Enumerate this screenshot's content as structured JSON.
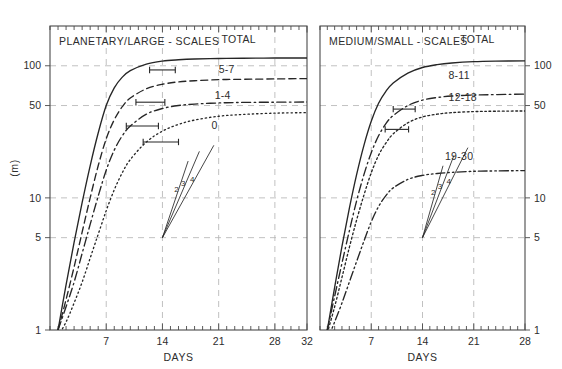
{
  "figure": {
    "background_color": "#ffffff",
    "width": 562,
    "height": 369
  },
  "chart_data": [
    {
      "type": "line",
      "panel": "left",
      "title": "PLANETARY/LARGE - SCALES",
      "xlabel": "DAYS",
      "ylabel": "(m)",
      "xlim": [
        0,
        32
      ],
      "ylim": [
        1,
        200
      ],
      "yscale": "log",
      "xticks": [
        7,
        14,
        21,
        28,
        32
      ],
      "xticklabels": [
        "7",
        "14",
        "21",
        "28",
        "32"
      ],
      "yticks": [
        1,
        5,
        10,
        50,
        100
      ],
      "yticklabels": [
        "1",
        "5",
        "10",
        "50",
        "100"
      ],
      "ylabel_side": "left",
      "grid": true,
      "legend": "inline-labels",
      "series": [
        {
          "name": "TOTAL",
          "style": "solid",
          "label": "TOTAL",
          "label_x": 23.5,
          "label_y": 150,
          "saturation": 120,
          "growth_day": 7.2,
          "x": [
            1,
            2,
            3,
            4,
            5,
            6,
            7,
            8,
            9,
            10,
            12,
            14,
            16,
            18,
            21,
            24,
            28,
            32
          ],
          "y": [
            1.0,
            2.2,
            4.6,
            9.2,
            17.5,
            31.0,
            50.0,
            68.0,
            82.0,
            92.0,
            103.0,
            108.5,
            111.0,
            112.5,
            113.5,
            114.0,
            114.5,
            114.5
          ],
          "errorbar": {
            "x": 14,
            "y": 93,
            "halfwidth_days": 1.6
          }
        },
        {
          "name": "5-7",
          "style": "dashed",
          "label": "5-7",
          "label_x": 22.0,
          "label_y": 88,
          "x": [
            1,
            2,
            3,
            4,
            5,
            6,
            7,
            8,
            9,
            10,
            12,
            14,
            16,
            18,
            21,
            24,
            28,
            32
          ],
          "y": [
            1.0,
            1.7,
            3.0,
            5.5,
            10.0,
            17.5,
            28.0,
            39.0,
            49.0,
            57.0,
            67.0,
            72.5,
            75.5,
            77.0,
            78.5,
            79.0,
            79.5,
            80.0
          ],
          "errorbar": {
            "x": 12.5,
            "y": 53,
            "halfwidth_days": 1.8
          }
        },
        {
          "name": "1-4",
          "style": "dashdot",
          "label": "1-4",
          "label_x": 21.5,
          "label_y": 56,
          "x": [
            1,
            2,
            3,
            4,
            5,
            6,
            7,
            8,
            9,
            10,
            12,
            14,
            16,
            18,
            21,
            24,
            28,
            32
          ],
          "y": [
            1.0,
            1.5,
            2.3,
            3.8,
            6.3,
            10.3,
            16.2,
            23.0,
            29.5,
            35.0,
            43.0,
            47.5,
            50.0,
            51.3,
            52.3,
            52.8,
            53.0,
            53.2
          ],
          "errorbar": {
            "x": 11.5,
            "y": 35,
            "halfwidth_days": 2.0
          }
        },
        {
          "name": "0",
          "style": "dotted",
          "label": "0",
          "label_x": 20.5,
          "label_y": 33,
          "x": [
            1,
            2,
            3,
            4,
            5,
            6,
            7,
            8,
            9,
            10,
            12,
            14,
            16,
            18,
            21,
            24,
            28,
            32
          ],
          "y": [
            0.9,
            1.15,
            1.6,
            2.3,
            3.5,
            5.3,
            8.0,
            11.5,
            15.5,
            19.5,
            26.5,
            32.0,
            36.0,
            38.8,
            41.5,
            42.8,
            43.8,
            44.2
          ],
          "errorbar": {
            "x": 13.8,
            "y": 26.5,
            "halfwidth_days": 2.2
          }
        }
      ],
      "fan_annotation": {
        "origin_x": 14,
        "origin_y": 5,
        "rays": [
          {
            "label": "2",
            "end_x": 17.2,
            "end_y": 19.0
          },
          {
            "label": "3",
            "end_x": 18.6,
            "end_y": 22.5
          },
          {
            "label": "4",
            "end_x": 20.4,
            "end_y": 25.0
          }
        ]
      }
    },
    {
      "type": "line",
      "panel": "right",
      "title": "MEDIUM/SMALL - SCALES",
      "xlabel": "DAYS",
      "ylabel": "",
      "xlim": [
        0,
        28
      ],
      "ylim": [
        1,
        200
      ],
      "yscale": "log",
      "xticks": [
        7,
        14,
        21,
        28
      ],
      "xticklabels": [
        "7",
        "14",
        "21",
        "28"
      ],
      "yticks": [
        1,
        5,
        10,
        50,
        100
      ],
      "yticklabels": [
        "1",
        "5",
        "10",
        "50",
        "100"
      ],
      "ylabel_side": "right",
      "grid": true,
      "legend": "inline-labels",
      "series": [
        {
          "name": "TOTAL",
          "style": "solid",
          "label": "TOTAL",
          "label_x": 21.5,
          "label_y": 150,
          "x": [
            1,
            2,
            3,
            4,
            5,
            6,
            7,
            8,
            9,
            10,
            12,
            14,
            16,
            18,
            21,
            24,
            28
          ],
          "y": [
            1.0,
            2.1,
            4.3,
            8.3,
            15.0,
            25.0,
            38.0,
            52.0,
            64.0,
            74.0,
            88.0,
            97.0,
            102.0,
            105.0,
            107.5,
            108.5,
            109.0
          ],
          "errorbar": null
        },
        {
          "name": "8-11",
          "style": "dashdot",
          "label": "8-11",
          "label_x": 19.0,
          "label_y": 80,
          "x": [
            1,
            2,
            3,
            4,
            5,
            6,
            7,
            8,
            9,
            10,
            12,
            14,
            16,
            18,
            21,
            24,
            28
          ],
          "y": [
            1.0,
            1.8,
            3.2,
            5.6,
            9.5,
            15.0,
            22.0,
            29.5,
            36.5,
            42.0,
            50.0,
            55.0,
            57.5,
            59.0,
            60.0,
            60.5,
            61.0
          ],
          "errorbar": {
            "x": 11.5,
            "y": 47,
            "halfwidth_days": 1.5
          }
        },
        {
          "name": "12-18",
          "style": "circle-dotted",
          "label": "12-18",
          "label_x": 19.5,
          "label_y": 54,
          "x": [
            1,
            2,
            3,
            4,
            5,
            6,
            7,
            8,
            9,
            10,
            12,
            14,
            16,
            18,
            21,
            24,
            28
          ],
          "y": [
            0.95,
            1.5,
            2.5,
            4.2,
            6.8,
            10.5,
            15.5,
            21.0,
            26.0,
            30.5,
            37.0,
            41.0,
            43.0,
            44.2,
            45.0,
            45.3,
            45.5
          ],
          "errorbar": {
            "x": 10.5,
            "y": 33,
            "halfwidth_days": 1.6
          }
        },
        {
          "name": "19-30",
          "style": "dashdotdot",
          "label": "19-30",
          "label_x": 19.0,
          "label_y": 19.5,
          "x": [
            1,
            2,
            3,
            4,
            5,
            6,
            7,
            8,
            9,
            10,
            12,
            14,
            16,
            18,
            21,
            24,
            28
          ],
          "y": [
            0.85,
            1.15,
            1.6,
            2.3,
            3.3,
            4.7,
            6.6,
            8.6,
            10.4,
            11.9,
            13.8,
            14.8,
            15.3,
            15.6,
            15.9,
            16.0,
            16.1
          ],
          "errorbar": null
        }
      ],
      "fan_annotation": {
        "origin_x": 14,
        "origin_y": 5,
        "rays": [
          {
            "label": "2",
            "end_x": 16.8,
            "end_y": 17.5
          },
          {
            "label": "3",
            "end_x": 18.3,
            "end_y": 21.0
          },
          {
            "label": "4",
            "end_x": 20.2,
            "end_y": 24.0
          }
        ]
      }
    }
  ],
  "colors": {
    "curve": "#262626",
    "frame": "#4a4a4a",
    "grid": "#b6b6b6",
    "text": "#2d2d2d"
  }
}
